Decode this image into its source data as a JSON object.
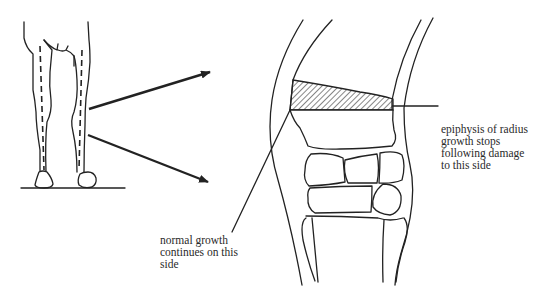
{
  "figure": {
    "type": "anatomical-diagram",
    "colors": {
      "line": "#222222",
      "background": "#ffffff",
      "text": "#2a2a2a"
    }
  },
  "panels": {
    "left": {
      "name": "horse-front-legs",
      "description": "front view of horse forelegs with dashed bone axis lines, standing on ground line"
    },
    "right": {
      "name": "carpal-joint-closeup",
      "description": "enlarged carpus showing radius epiphysis with hatched damaged region and carpal bones"
    }
  },
  "arrows": [
    {
      "name": "arrow-upper",
      "from": "left leg",
      "to": "closeup"
    },
    {
      "name": "arrow-lower",
      "from": "left leg",
      "to": "closeup"
    }
  ],
  "labels": {
    "epiphysis": "epiphysis of radius\ngrowth stops\nfollowing damage\nto this side",
    "normal": "normal growth\ncontinues on this\nside"
  }
}
